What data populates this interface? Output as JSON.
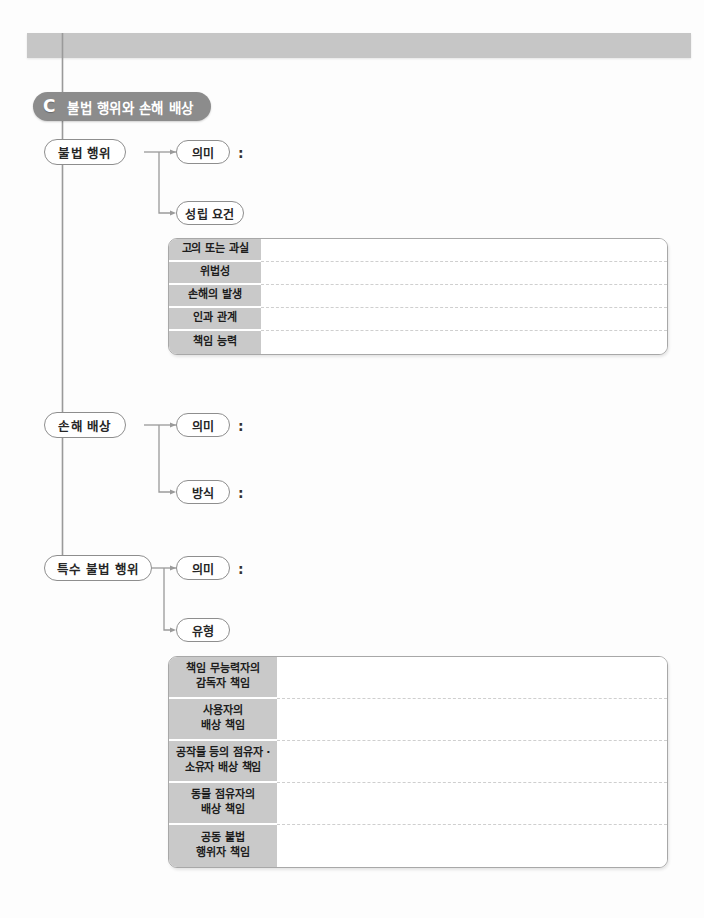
{
  "header": {
    "bar_text": ""
  },
  "chapter": {
    "letter": "C",
    "title": "불법 행위와 손해 배상"
  },
  "branches": [
    {
      "main_label": "불법 행위",
      "sub_nodes": [
        {
          "label": "의미",
          "colon": ":"
        },
        {
          "label": "성립 요건",
          "colon": ""
        }
      ]
    },
    {
      "main_label": "손해 배상",
      "sub_nodes": [
        {
          "label": "의미",
          "colon": ":"
        },
        {
          "label": "방식",
          "colon": ":"
        }
      ]
    },
    {
      "main_label": "특수 불법 행위",
      "sub_nodes": [
        {
          "label": "의미",
          "colon": ":"
        },
        {
          "label": "유형",
          "colon": ""
        }
      ]
    }
  ],
  "tables": [
    {
      "rows": [
        {
          "label": "고의 또는 과실",
          "value": ""
        },
        {
          "label": "위법성",
          "value": ""
        },
        {
          "label": "손해의 발생",
          "value": ""
        },
        {
          "label": "인과 관계",
          "value": ""
        },
        {
          "label": "책임 능력",
          "value": ""
        }
      ]
    },
    {
      "rows": [
        {
          "label": "책임 무능력자의\n감독자 책임",
          "value": ""
        },
        {
          "label": "사용자의\n배상 책임",
          "value": ""
        },
        {
          "label": "공작물 등의 점유자 ·\n소유자 배상 책임",
          "value": ""
        },
        {
          "label": "동물 점유자의\n배상 책임",
          "value": ""
        },
        {
          "label": "공동 불법\n행위자 책임",
          "value": ""
        }
      ]
    }
  ],
  "colors": {
    "header_bar": "#c6c6c6",
    "badge": "#8c8c8c",
    "table_label": "#c9c9c9",
    "node_border": "#8e8e8e",
    "line": "#9a9a9a"
  }
}
